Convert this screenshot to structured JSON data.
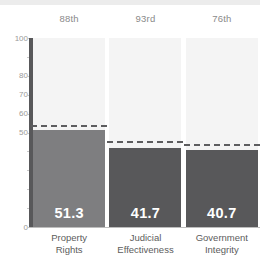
{
  "chart_data": {
    "type": "bar",
    "title": "",
    "subtitle": "",
    "xlabel": "",
    "ylabel": "",
    "ylim": [
      0,
      100
    ],
    "grid": false,
    "legend": "none",
    "categories": [
      "Property Rights",
      "Judicial Effectiveness",
      "Government Integrity"
    ],
    "category_lines": [
      [
        "Property",
        "Rights"
      ],
      [
        "Judicial",
        "Effectiveness"
      ],
      [
        "Government",
        "Integrity"
      ]
    ],
    "values": [
      51.3,
      41.7,
      40.7
    ],
    "value_labels": [
      "51.3",
      "41.7",
      "40.7"
    ],
    "percentile_labels": [
      "88th",
      "93rd",
      "76th"
    ],
    "average_markers": [
      53.0,
      44.5,
      43.0
    ],
    "bar_colors": [
      "#7e7e80",
      "#58585a",
      "#58585a"
    ],
    "marker_color": "#5d5d5f",
    "y_ticks": [
      {
        "value": 100,
        "label": "100"
      },
      {
        "value": 90,
        "label": ""
      },
      {
        "value": 80,
        "label": "80"
      },
      {
        "value": 70,
        "label": "70"
      },
      {
        "value": 60,
        "label": "60"
      },
      {
        "value": 50,
        "label": "50"
      },
      {
        "value": 40,
        "label": ""
      },
      {
        "value": 30,
        "label": ""
      },
      {
        "value": 20,
        "label": ""
      },
      {
        "value": 10,
        "label": ""
      },
      {
        "value": 0,
        "label": "0"
      }
    ],
    "colors": {
      "band": "#f4f4f4",
      "axis": "#58585a",
      "baseline": "#bdbdbd",
      "tick_text": "#9a9a9a",
      "header_text": "#8a8a8a",
      "category_text": "#5c5c5c",
      "value_text": "#ffffff",
      "top_band": "#ececec",
      "background": "#ffffff"
    }
  }
}
